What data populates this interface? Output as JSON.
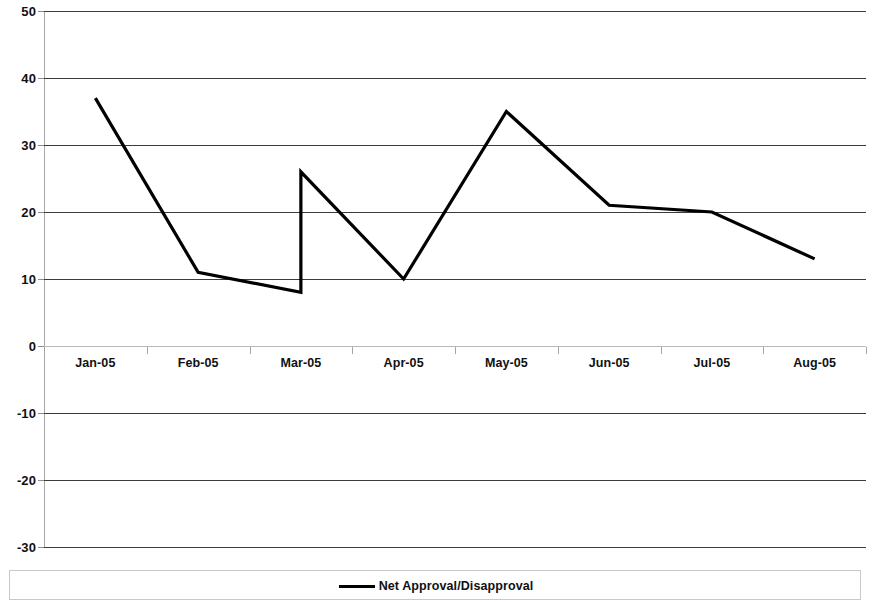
{
  "chart_data": {
    "type": "line",
    "title": "",
    "subtitle": "",
    "xlabel": "",
    "ylabel": "",
    "categories": [
      "Jan-05",
      "Feb-05",
      "Mar-05",
      "Apr-05",
      "May-05",
      "Jun-05",
      "Jul-05",
      "Aug-05"
    ],
    "ylim": [
      -30,
      50
    ],
    "y_ticks": [
      50,
      40,
      30,
      20,
      10,
      0,
      -10,
      -20,
      -30
    ],
    "y_tick_labels": [
      "50",
      "40",
      "30",
      "20",
      "10",
      "0",
      "-10",
      "-20",
      "-30"
    ],
    "grid": true,
    "grid_axis": "y",
    "legend_position": "bottom",
    "series": [
      {
        "name": "Net Approval/Disapproval",
        "color": "#000000",
        "line_width": 3.2,
        "values": [
          37,
          11,
          8,
          10,
          35,
          21,
          20,
          13
        ],
        "break_at": "Mar-05",
        "break_value_after": 26,
        "points": [
          {
            "x": "Jan-05",
            "y": 37
          },
          {
            "x": "Feb-05",
            "y": 11
          },
          {
            "x": "Mar-05",
            "y": 8
          },
          {
            "x": "Mar-05",
            "y": 26
          },
          {
            "x": "Apr-05",
            "y": 10
          },
          {
            "x": "May-05",
            "y": 35
          },
          {
            "x": "Jun-05",
            "y": 21
          },
          {
            "x": "Jul-05",
            "y": 20
          },
          {
            "x": "Aug-05",
            "y": 13
          }
        ]
      }
    ]
  },
  "legend": {
    "entries": [
      {
        "label": "Net Approval/Disapproval",
        "color": "#000000"
      }
    ]
  },
  "colors": {
    "series_line": "#000000",
    "gridline": "#3c3c3c",
    "zero_line": "#b9b9b9",
    "axis_line": "#a8a8a8",
    "legend_border": "#c9c9c9",
    "tick_text": "#111111",
    "background": "#ffffff"
  }
}
